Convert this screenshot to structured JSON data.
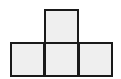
{
  "diagram": {
    "shape": "T-tetromino",
    "cell_size": 35,
    "fill_color": "#efefef",
    "stroke_color": "#1a1a1a",
    "cells": [
      {
        "name": "top-center",
        "x": 44,
        "y": 9
      },
      {
        "name": "bottom-left",
        "x": 10,
        "y": 42
      },
      {
        "name": "bottom-center",
        "x": 44,
        "y": 42
      },
      {
        "name": "bottom-right",
        "x": 78,
        "y": 42
      }
    ]
  }
}
